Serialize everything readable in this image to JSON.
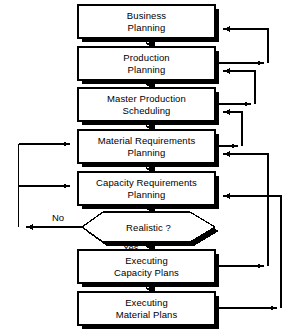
{
  "diagram": {
    "type": "flowchart",
    "background_color": "#ffffff",
    "line_color": "#000000",
    "box_fill_color": "#ffffff",
    "shadow_color": "#000000",
    "nodes": [
      {
        "id": "business-planning",
        "shape": "process-box",
        "line1": "Business",
        "line2": "Planning"
      },
      {
        "id": "production-planning",
        "shape": "process-box",
        "line1": "Production",
        "line2": "Planning"
      },
      {
        "id": "master-production-scheduling",
        "shape": "process-box",
        "line1": "Master Production",
        "line2": "Scheduling"
      },
      {
        "id": "material-requirements-planning",
        "shape": "process-box",
        "line1": "Material Requirements",
        "line2": "Planning"
      },
      {
        "id": "capacity-requirements-planning",
        "shape": "process-box",
        "line1": "Capacity Requirements",
        "line2": "Planning"
      },
      {
        "id": "realistic-decision",
        "shape": "decision-hexagon",
        "line1": "Realistic ?",
        "line2": ""
      },
      {
        "id": "executing-capacity-plans",
        "shape": "process-box",
        "line1": "Executing",
        "line2": "Capacity Plans"
      },
      {
        "id": "executing-material-plans",
        "shape": "process-box",
        "line1": "Executing",
        "line2": "Material Plans"
      }
    ],
    "edge_labels": {
      "no": "No",
      "yes": "Yes"
    }
  }
}
